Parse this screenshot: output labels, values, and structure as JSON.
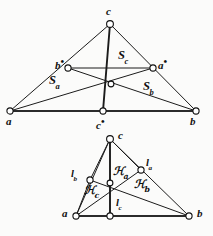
{
  "figure": {
    "background_color": "#fbfbfa",
    "ink_color": "#111111",
    "panels": [
      {
        "id": "top-panel",
        "name": "median-triangle-with-subtriangle-areas",
        "vertices": [
          {
            "name": "a",
            "label": "a",
            "x": 10,
            "y": 111
          },
          {
            "name": "b",
            "label": "b",
            "x": 196,
            "y": 111
          },
          {
            "name": "c",
            "label": "c",
            "x": 110,
            "y": 24
          }
        ],
        "midpoints": [
          {
            "name": "a-star",
            "label": "a",
            "mark": "•",
            "x": 153,
            "y": 68
          },
          {
            "name": "b-star",
            "label": "b",
            "mark": "•",
            "x": 68,
            "y": 68
          },
          {
            "name": "c-star",
            "label": "c",
            "mark": "•",
            "x": 103,
            "y": 111
          }
        ],
        "centroid": {
          "name": "centroid",
          "x": 111,
          "y": 84
        },
        "regions": [
          {
            "name": "region-Sa",
            "label": "S",
            "sub": "a",
            "x": 57,
            "y": 82
          },
          {
            "name": "region-Sb",
            "label": "S",
            "sub": "b",
            "x": 150,
            "y": 88
          },
          {
            "name": "region-Sc",
            "label": "S",
            "sub": "c",
            "x": 124,
            "y": 57
          }
        ]
      },
      {
        "id": "bottom-panel",
        "name": "altitude-triangle-with-subtriangle-areas",
        "vertices": [
          {
            "name": "a",
            "label": "a",
            "x": 76,
            "y": 216
          },
          {
            "name": "b",
            "label": "b",
            "x": 189,
            "y": 216
          },
          {
            "name": "c",
            "label": "c",
            "x": 110,
            "y": 139
          }
        ],
        "feet": [
          {
            "name": "foot-la",
            "label": "l",
            "sub": "a",
            "x": 141,
            "y": 170
          },
          {
            "name": "foot-lb",
            "label": "l",
            "sub": "b",
            "x": 90,
            "y": 180
          },
          {
            "name": "foot-lc",
            "label": "l",
            "sub": "c",
            "x": 110,
            "y": 216
          }
        ],
        "orthocenter": {
          "name": "orthocenter",
          "x": 110,
          "y": 183
        },
        "regions": [
          {
            "name": "region-Ha",
            "label": "H",
            "sub": "a",
            "x": 118,
            "y": 173
          },
          {
            "name": "region-Hb",
            "label": "H",
            "sub": "b",
            "x": 140,
            "y": 186
          },
          {
            "name": "region-Hc",
            "label": "H",
            "sub": "c",
            "x": 90,
            "y": 192
          }
        ]
      }
    ]
  },
  "labels": {
    "top": {
      "a": "a",
      "b": "b",
      "c": "c",
      "a_star": "a",
      "b_star": "b",
      "c_star": "c",
      "star_mark": "•",
      "S": "S",
      "sub_a": "a",
      "sub_b": "b",
      "sub_c": "c"
    },
    "bottom": {
      "a": "a",
      "b": "b",
      "c": "c",
      "l": "l",
      "H": "ℋ",
      "sub_a": "a",
      "sub_b": "b",
      "sub_c": "c"
    }
  }
}
